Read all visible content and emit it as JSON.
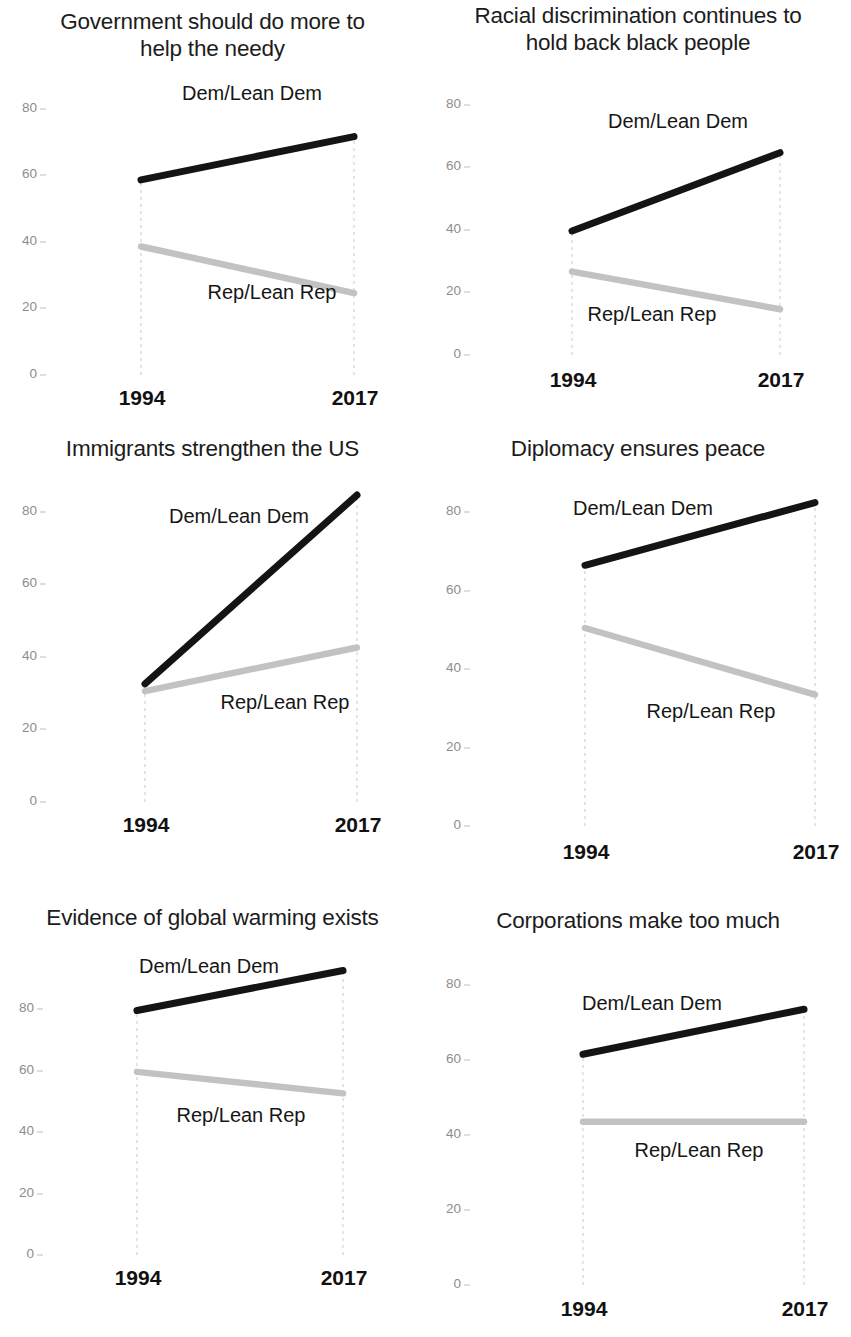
{
  "chart_data": {
    "type": "line",
    "title": "",
    "subtitle": "",
    "xlabel": "",
    "ylabel": "",
    "x": [
      "1994",
      "2017"
    ],
    "ylim": [
      0,
      100
    ],
    "ytick_labels": [
      "0",
      "20",
      "40",
      "60",
      "80"
    ],
    "ytick_values": [
      0,
      20,
      40,
      60,
      80
    ],
    "grid": "vertical-dashed-at-x-positions",
    "legend_position": "inline-annotations",
    "series_names": [
      "Dem/Lean Dem",
      "Rep/Lean Rep"
    ],
    "series_colors": {
      "dem": "#141414",
      "rep": "#c2c2c2"
    },
    "panels": [
      {
        "id": "government-help-needy",
        "title": "Government should do more to help the needy",
        "title_lines": [
          "Government should do more to",
          "help the needy"
        ],
        "series": [
          {
            "name": "Dem/Lean Dem",
            "values": [
              58,
              71
            ]
          },
          {
            "name": "Rep/Lean Rep",
            "values": [
              38,
              24
            ]
          }
        ],
        "x_labels": [
          "1994",
          "2017"
        ]
      },
      {
        "id": "racial-discrimination",
        "title": "Racial discrimination continues to hold back black people",
        "title_lines": [
          "Racial discrimination continues to",
          "hold back black people"
        ],
        "series": [
          {
            "name": "Dem/Lean Dem",
            "values": [
              39,
              64
            ]
          },
          {
            "name": "Rep/Lean Rep",
            "values": [
              26,
              14
            ]
          }
        ],
        "x_labels": [
          "1994",
          "2017"
        ]
      },
      {
        "id": "immigrants-strengthen-us",
        "title": "Immigrants strengthen the US",
        "title_lines": [
          "Immigrants strengthen the US"
        ],
        "series": [
          {
            "name": "Dem/Lean Dem",
            "values": [
              32,
              84
            ]
          },
          {
            "name": "Rep/Lean Rep",
            "values": [
              30,
              42
            ]
          }
        ],
        "x_labels": [
          "1994",
          "2017"
        ]
      },
      {
        "id": "diplomacy-ensures-peace",
        "title": "Diplomacy ensures peace",
        "title_lines": [
          "Diplomacy ensures peace"
        ],
        "series": [
          {
            "name": "Dem/Lean Dem",
            "values": [
              66,
              82
            ]
          },
          {
            "name": "Rep/Lean Rep",
            "values": [
              50,
              33
            ]
          }
        ],
        "x_labels": [
          "1994",
          "2017"
        ]
      },
      {
        "id": "global-warming-evidence",
        "title": "Evidence of global warming exists",
        "title_lines": [
          "Evidence of global warming exists"
        ],
        "series": [
          {
            "name": "Dem/Lean Dem",
            "values": [
              79,
              92
            ]
          },
          {
            "name": "Rep/Lean Rep",
            "values": [
              59,
              52
            ]
          }
        ],
        "x_labels": [
          "1994",
          "2017"
        ]
      },
      {
        "id": "corporations-make-too-much",
        "title": "Corporations make too much",
        "title_lines": [
          "Corporations make too much"
        ],
        "series": [
          {
            "name": "Dem/Lean Dem",
            "values": [
              61,
              73
            ]
          },
          {
            "name": "Rep/Lean Rep",
            "values": [
              43,
              43
            ]
          }
        ],
        "x_labels": [
          "1994",
          "2017"
        ]
      }
    ]
  },
  "panel_labels": {
    "p0": {
      "title_line1": "Government should do more to",
      "title_line2": "help the needy",
      "dem": "Dem/Lean Dem",
      "rep": "Rep/Lean Rep",
      "x0": "1994",
      "x1": "2017",
      "y0": "0",
      "y20": "20",
      "y40": "40",
      "y60": "60",
      "y80": "80"
    },
    "p1": {
      "title_line1": "Racial discrimination continues to",
      "title_line2": "hold back black people",
      "dem": "Dem/Lean Dem",
      "rep": "Rep/Lean Rep",
      "x0": "1994",
      "x1": "2017",
      "y0": "0",
      "y20": "20",
      "y40": "40",
      "y60": "60",
      "y80": "80"
    },
    "p2": {
      "title_line1": "Immigrants strengthen the US",
      "title_line2": "",
      "dem": "Dem/Lean Dem",
      "rep": "Rep/Lean Rep",
      "x0": "1994",
      "x1": "2017",
      "y0": "0",
      "y20": "20",
      "y40": "40",
      "y60": "60",
      "y80": "80"
    },
    "p3": {
      "title_line1": "Diplomacy ensures peace",
      "title_line2": "",
      "dem": "Dem/Lean Dem",
      "rep": "Rep/Lean Rep",
      "x0": "1994",
      "x1": "2017",
      "y0": "0",
      "y20": "20",
      "y40": "40",
      "y60": "60",
      "y80": "80"
    },
    "p4": {
      "title_line1": "Evidence of global warming exists",
      "title_line2": "",
      "dem": "Dem/Lean Dem",
      "rep": "Rep/Lean Rep",
      "x0": "1994",
      "x1": "2017",
      "y0": "0",
      "y20": "20",
      "y40": "40",
      "y60": "60",
      "y80": "80"
    },
    "p5": {
      "title_line1": "Corporations make too much",
      "title_line2": "",
      "dem": "Dem/Lean Dem",
      "rep": "Rep/Lean Rep",
      "x0": "1994",
      "x1": "2017",
      "y0": "0",
      "y20": "20",
      "y40": "40",
      "y60": "60",
      "y80": "80"
    }
  },
  "layout": {
    "panels": [
      {
        "key": "p0",
        "box": {
          "left": 0,
          "top": 0,
          "width": 425,
          "height": 425
        },
        "title_top": 8,
        "axis": {
          "x0": 141,
          "x1": 354,
          "y_of_0": 373,
          "y_of_100": 40
        },
        "ylabel_x": 28,
        "xlabel_y": 386,
        "dem_label": {
          "x": 252,
          "y": 82
        },
        "rep_label": {
          "x": 272,
          "y": 281
        }
      },
      {
        "key": "p1",
        "box": {
          "left": 425,
          "top": 0,
          "width": 426,
          "height": 425
        },
        "title_top": 2,
        "axis": {
          "x0": 572,
          "x1": 780,
          "y_of_0": 353,
          "y_of_100": 40
        },
        "ylabel_x": 452,
        "xlabel_y": 368,
        "dem_label": {
          "x": 678,
          "y": 110
        },
        "rep_label": {
          "x": 652,
          "y": 303
        }
      },
      {
        "key": "p2",
        "box": {
          "left": 0,
          "top": 425,
          "width": 425,
          "height": 462
        },
        "title_top": 10,
        "axis": {
          "x0": 145,
          "x1": 357,
          "y_of_0": 800,
          "y_of_100": 437
        },
        "ylabel_x": 28,
        "xlabel_y": 813,
        "dem_label": {
          "x": 239,
          "y": 505
        },
        "rep_label": {
          "x": 285,
          "y": 691
        }
      },
      {
        "key": "p3",
        "box": {
          "left": 425,
          "top": 425,
          "width": 426,
          "height": 462
        },
        "title_top": 10,
        "axis": {
          "x0": 585,
          "x1": 815,
          "y_of_0": 824,
          "y_of_100": 432
        },
        "ylabel_x": 452,
        "xlabel_y": 840,
        "dem_label": {
          "x": 643,
          "y": 497
        },
        "rep_label": {
          "x": 711,
          "y": 700
        }
      },
      {
        "key": "p4",
        "box": {
          "left": 0,
          "top": 887,
          "width": 425,
          "height": 450
        },
        "title_top": 17,
        "axis": {
          "x0": 137,
          "x1": 343,
          "y_of_0": 1253,
          "y_of_100": 946
        },
        "ylabel_x": 25,
        "xlabel_y": 1266,
        "dem_label": {
          "x": 209,
          "y": 955
        },
        "rep_label": {
          "x": 241,
          "y": 1104
        }
      },
      {
        "key": "p5",
        "box": {
          "left": 425,
          "top": 887,
          "width": 426,
          "height": 450
        },
        "title_top": 20,
        "axis": {
          "x0": 583,
          "x1": 804,
          "y_of_0": 1283,
          "y_of_100": 908
        },
        "ylabel_x": 452,
        "xlabel_y": 1297,
        "dem_label": {
          "x": 652,
          "y": 992
        },
        "rep_label": {
          "x": 699,
          "y": 1139
        }
      }
    ]
  }
}
